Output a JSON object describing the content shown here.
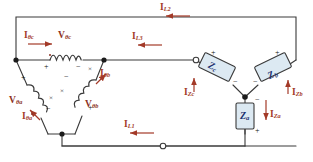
{
  "diagram": {
    "colors": {
      "wire": "#3a3a3a",
      "current_label": "#a33a28",
      "voltage_label": "#8d3224",
      "impedance_label": "#1a2f6e",
      "impedance_fill": "#dce9f2",
      "background": "#ffffff",
      "arrow": "#a33a28"
    },
    "source": {
      "type": "delta",
      "windings": [
        {
          "id": "bc",
          "voltage_label": "V",
          "voltage_sub": "θc",
          "current_label": "I",
          "current_sub": "θc",
          "polarity_left": "+",
          "polarity_right": "−",
          "orientation": "horizontal-top"
        },
        {
          "id": "ba",
          "voltage_label": "V",
          "voltage_sub": "θa",
          "current_label": "I",
          "current_sub": "θa",
          "polarity_left": "+",
          "polarity_right": "−",
          "orientation": "diagonal-left"
        },
        {
          "id": "bb",
          "voltage_label": "V",
          "voltage_sub": "θb",
          "current_label": "I",
          "current_sub": "θb",
          "polarity_left": "+",
          "polarity_right": "−",
          "orientation": "diagonal-right"
        }
      ]
    },
    "lines": [
      {
        "id": "L1",
        "label": "I",
        "sub": "L1",
        "direction": "left",
        "position": "bottom"
      },
      {
        "id": "L2",
        "label": "I",
        "sub": "L2",
        "direction": "left",
        "position": "top"
      },
      {
        "id": "L3",
        "label": "I",
        "sub": "L3",
        "direction": "left",
        "position": "middle"
      }
    ],
    "load": {
      "type": "wye",
      "elements": [
        {
          "id": "Zc",
          "label": "Z",
          "sub": "c",
          "current_label": "I",
          "current_sub": "Zc",
          "polarity_outer": "+",
          "polarity_inner": "−",
          "orientation": "tilted-left"
        },
        {
          "id": "Zb",
          "label": "Z",
          "sub": "b",
          "current_label": "I",
          "current_sub": "Zb",
          "polarity_outer": "+",
          "polarity_inner": "−",
          "orientation": "tilted-right"
        },
        {
          "id": "Za",
          "label": "Z",
          "sub": "a",
          "current_label": "I",
          "current_sub": "Za",
          "polarity_outer": "−",
          "polarity_inner": "+",
          "orientation": "vertical"
        }
      ]
    },
    "nodes": [
      {
        "id": "source-node-b",
        "style": "filled"
      },
      {
        "id": "source-node-top-right",
        "style": "filled"
      },
      {
        "id": "source-node-bottom",
        "style": "filled"
      },
      {
        "id": "line-l3-terminal",
        "style": "open"
      },
      {
        "id": "line-l1-terminal",
        "style": "open"
      },
      {
        "id": "load-neutral",
        "style": "filled"
      }
    ]
  }
}
